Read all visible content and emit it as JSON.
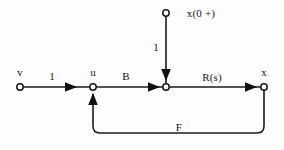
{
  "diagram": {
    "type": "signal-flow-graph",
    "stroke_color": "#1a1a1a",
    "background_color": "#fdfdfd",
    "node_fill": "#ffffff",
    "nodes": [
      {
        "id": "v",
        "label": "v",
        "x": 20,
        "y": 87,
        "label_x": 20,
        "label_y": 72
      },
      {
        "id": "u",
        "label": "u",
        "x": 93,
        "y": 87,
        "label_x": 93,
        "label_y": 72
      },
      {
        "id": "mid",
        "label": "",
        "x": 166,
        "y": 87,
        "label_x": 166,
        "label_y": 72
      },
      {
        "id": "x",
        "label": "x",
        "x": 264,
        "y": 87,
        "label_x": 264,
        "label_y": 72
      },
      {
        "id": "init",
        "label": "x(0 +)",
        "x": 166,
        "y": 13,
        "label_x": 201,
        "label_y": 13
      }
    ],
    "edges": [
      {
        "id": "v-to-u",
        "from": "v",
        "to": "u",
        "label": "1",
        "label_x": 52,
        "label_y": 76
      },
      {
        "id": "u-to-mid",
        "from": "u",
        "to": "mid",
        "label": "B",
        "label_x": 126,
        "label_y": 76
      },
      {
        "id": "init-to-mid",
        "from": "init",
        "to": "mid",
        "label": "1",
        "label_x": 156,
        "label_y": 47
      },
      {
        "id": "mid-to-x",
        "from": "mid",
        "to": "x",
        "label": "R(s)",
        "label_x": 212,
        "label_y": 77
      },
      {
        "id": "x-to-u",
        "from": "x",
        "to": "u",
        "label": "F",
        "label_x": 179,
        "label_y": 127
      }
    ]
  }
}
